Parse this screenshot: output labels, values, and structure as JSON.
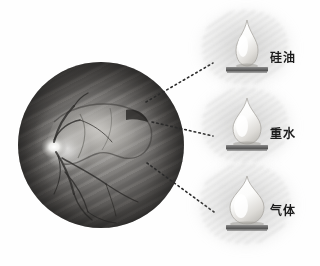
{
  "figure": {
    "background_color": "#fefefe"
  },
  "fundus": {
    "name": "fundus-photograph",
    "description": "Grayscale fundus photograph showing retinal detachment",
    "cx": 101,
    "cy": 145,
    "r": 83,
    "features": {
      "optic_disc_label": "optic disc",
      "vessels_label": "retinal vessels",
      "detachment_label": "detached retina border"
    },
    "colors": {
      "rim_dark": "#141413",
      "mid_tone": "#6f6d6b",
      "disc_highlight": "#ffffff"
    }
  },
  "agents": [
    {
      "id": "silicone-oil",
      "label": "硅油",
      "droplet_shape": "tall-narrow",
      "contact_angle_description": "high contact angle, narrow base",
      "drop_x": 218,
      "drop_y": 18,
      "drop_w": 52,
      "drop_h": 58,
      "label_x": 270,
      "label_y": 52,
      "bar_color": "#6f6f6f",
      "leader": {
        "x1": 146,
        "y1": 102,
        "x2": 213,
        "y2": 63
      }
    },
    {
      "id": "heavy-water",
      "label": "重水",
      "droplet_shape": "medium-round",
      "contact_angle_description": "medium contact angle, wider base",
      "drop_x": 218,
      "drop_y": 95,
      "drop_w": 54,
      "drop_h": 56,
      "label_x": 270,
      "label_y": 128,
      "bar_color": "#6f6f6f",
      "leader": {
        "x1": 152,
        "y1": 122,
        "x2": 213,
        "y2": 136
      }
    },
    {
      "id": "gas",
      "label": "气体",
      "droplet_shape": "wide-spherical",
      "contact_angle_description": "low contact angle, widest base",
      "drop_x": 216,
      "drop_y": 173,
      "drop_w": 58,
      "drop_h": 56,
      "label_x": 270,
      "label_y": 205,
      "bar_color": "#6f6f6f",
      "leader": {
        "x1": 147,
        "y1": 163,
        "x2": 214,
        "y2": 212
      }
    }
  ],
  "leader_lines": {
    "style": "dotted",
    "color": "#2b2b2b",
    "dash": "1.6 3.2",
    "width": 1.6
  }
}
